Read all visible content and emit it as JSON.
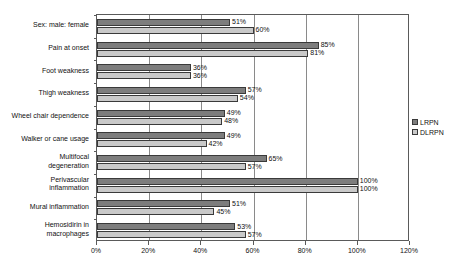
{
  "chart_data": {
    "type": "bar",
    "orientation": "horizontal",
    "title": "",
    "xlabel": "",
    "ylabel": "",
    "xlim": [
      0,
      120
    ],
    "xtick_values": [
      0,
      20,
      40,
      60,
      80,
      100,
      120
    ],
    "xtick_labels": [
      "0%",
      "20%",
      "40%",
      "60%",
      "80%",
      "100%",
      "120%"
    ],
    "grid": "vertical",
    "legend_position": "right",
    "categories": [
      "Sex: male: female",
      "Pain at onset",
      "Foot weakness",
      "Thigh weakness",
      "Wheel chair dependence",
      "Walker or cane usage",
      "Multifocal\ndegeneration",
      "Perivascular\ninflammation",
      "Mural inflammation",
      "Hemosidirin in\nmacrophages"
    ],
    "series": [
      {
        "name": "LRPN",
        "color": "#7d7d7d",
        "values": [
          51,
          85,
          36,
          57,
          49,
          49,
          65,
          100,
          51,
          53
        ],
        "value_labels": [
          "51%",
          "85%",
          "36%",
          "57%",
          "49%",
          "49%",
          "65%",
          "100%",
          "51%",
          "53%"
        ]
      },
      {
        "name": "DLRPN",
        "color": "#c9c9c9",
        "values": [
          60,
          81,
          36,
          54,
          48,
          42,
          57,
          100,
          45,
          57
        ],
        "value_labels": [
          "60%",
          "81%",
          "36%",
          "54%",
          "48%",
          "42%",
          "57%",
          "100%",
          "45%",
          "57%"
        ]
      }
    ]
  },
  "legend": {
    "items": [
      {
        "label": "LRPN",
        "swatch": "lrpn"
      },
      {
        "label": "DLRPN",
        "swatch": "dlrpn"
      }
    ]
  }
}
